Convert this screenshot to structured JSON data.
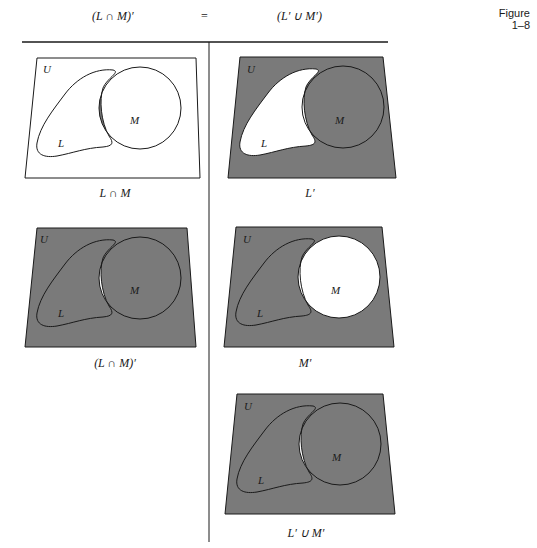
{
  "header": {
    "left": "(L ∩ M)′",
    "equals": "=",
    "right": "(L′ ∪ M′)",
    "figure_label": "Figure",
    "figure_number": "1–8"
  },
  "colors": {
    "shade": "#7a7a7a",
    "line": "#1a1a1a",
    "background": "#ffffff"
  },
  "panels": [
    {
      "id": "l-intersect-m",
      "universe": "U",
      "set_l": "L",
      "set_m": "M",
      "caption": "L ∩ M",
      "shaded": "intersection"
    },
    {
      "id": "l-complement",
      "universe": "U",
      "set_l": "L",
      "set_m": "M",
      "caption": "L′",
      "shaded": "outside L"
    },
    {
      "id": "l-intersect-m-complement",
      "universe": "U",
      "set_l": "L",
      "set_m": "M",
      "caption": "(L ∩ M)′",
      "shaded": "outside intersection"
    },
    {
      "id": "m-complement",
      "universe": "U",
      "set_l": "L",
      "set_m": "M",
      "caption": "M′",
      "shaded": "outside M"
    },
    {
      "id": "l-complement-union-m-complement",
      "universe": "U",
      "set_l": "L",
      "set_m": "M",
      "caption": "L′ ∪ M′",
      "shaded": "outside intersection"
    }
  ]
}
